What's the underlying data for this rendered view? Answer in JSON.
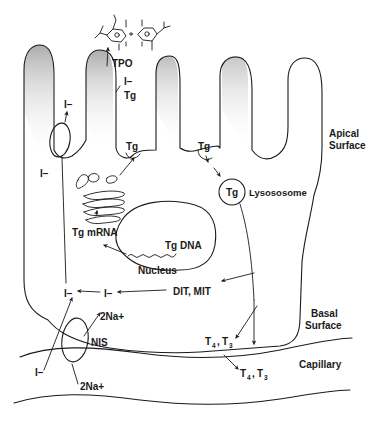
{
  "figure": {
    "colors": {
      "ink": "#1a1a1a",
      "shading": "#b8b8b8",
      "background": "#ffffff"
    }
  },
  "regions": {
    "apical_surface": {
      "line1": "Apical",
      "line2": "Surface"
    },
    "basal_surface": {
      "line1": "Basal",
      "line2": "Surface"
    },
    "capillary": "Capillary"
  },
  "organelles": {
    "nucleus": "Nucleus",
    "lysosome": "Lysososome",
    "lysosome_content": "Tg",
    "nis": "NIS"
  },
  "labels": {
    "tpo": "TPO",
    "iodide_tg_top": "I−",
    "tg_top": "Tg",
    "tg_exocytosis": "Tg",
    "tg_endocytosis": "Tg",
    "iodide_apical_out": "I−",
    "iodide_left": "I−",
    "tg_mrna": "Tg mRNA",
    "tg_dna": "Tg DNA",
    "dit_mit": "DIT, MIT",
    "iodide_recycled_mid": "I−",
    "iodide_recycled_left": "I−",
    "na_out": "2Na+",
    "na_in": "2Na+",
    "iodide_capillary": "I−",
    "t4t3_cell": {
      "t4": "T",
      "t4_sub": "4",
      "sep": ",",
      "t3": "T",
      "t3_sub": "3"
    },
    "t4t3_capillary": {
      "t4": "T",
      "t4_sub": "4",
      "sep": ",",
      "t3": "T",
      "t3_sub": "3"
    }
  },
  "pathways": [
    {
      "from": "Capillary I−",
      "via": "NIS",
      "to": "cytoplasm I−",
      "cotransport": "2Na+"
    },
    {
      "from": "cytoplasm I−",
      "via": "apical transporter",
      "to": "follicle lumen I−"
    },
    {
      "from": "Tg DNA",
      "to": "Tg mRNA",
      "then": "ER/Golgi",
      "then2": "exocytosis of Tg"
    },
    {
      "from": "I− + Tg",
      "via": "TPO",
      "to": "iodinated thyronine"
    },
    {
      "from": "Tg (endocytosis)",
      "to": "Lysososome",
      "products": [
        "DIT, MIT",
        "T4, T3"
      ]
    },
    {
      "from": "DIT, MIT",
      "to": "I− (recycled)"
    },
    {
      "from": "T4, T3 (cell)",
      "to": "T4, T3 (capillary)"
    }
  ]
}
